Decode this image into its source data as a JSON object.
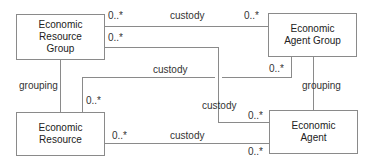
{
  "diagram": {
    "type": "uml-class-associations",
    "colors": {
      "line": "#8a8a8a",
      "box_border": "#8a8a8a",
      "text": "#222222"
    },
    "entities": [
      {
        "id": "erg",
        "label": "Economic\nResource\nGroup"
      },
      {
        "id": "eag",
        "label": "Economic\nAgent Group"
      },
      {
        "id": "er",
        "label": "Economic\nResource"
      },
      {
        "id": "ea",
        "label": "Economic\nAgent"
      }
    ],
    "associations": [
      {
        "from": "erg",
        "to": "eag",
        "name": "custody",
        "from_mult": "0..*",
        "to_mult": "0..*"
      },
      {
        "from": "erg",
        "to": "ea",
        "name": "custody",
        "from_mult": "0..*",
        "to_mult": "0..*"
      },
      {
        "from": "eag",
        "to": "er",
        "name": "custody",
        "from_mult": "0..*",
        "to_mult": "0..*"
      },
      {
        "from": "er",
        "to": "ea",
        "name": "custody",
        "from_mult": "0..*",
        "to_mult": "0..*"
      },
      {
        "from": "erg",
        "to": "er",
        "name": "grouping"
      },
      {
        "from": "eag",
        "to": "ea",
        "name": "grouping"
      }
    ]
  }
}
